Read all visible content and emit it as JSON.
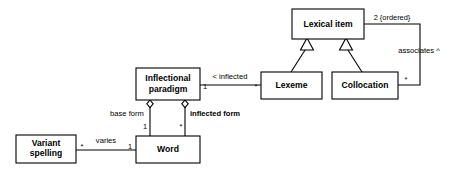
{
  "diagram": {
    "type": "uml-class-diagram",
    "background_color": "#ffffff",
    "line_color": "#000000",
    "fill_color": "#ffffff",
    "classes": [
      {
        "id": "lexical_item",
        "name": "Lexical item",
        "line1": "Lexical item",
        "line2": "",
        "x": 292,
        "y": 9,
        "w": 72,
        "h": 30
      },
      {
        "id": "lexeme",
        "name": "Lexeme",
        "line1": "Lexeme",
        "line2": "",
        "x": 261,
        "y": 72,
        "w": 61,
        "h": 27
      },
      {
        "id": "collocation",
        "name": "Collocation",
        "line1": "Collocation",
        "line2": "",
        "x": 332,
        "y": 72,
        "w": 66,
        "h": 27
      },
      {
        "id": "inflectional_paradigm",
        "name": "Inflectional paradigm",
        "line1": "Inflectional",
        "line2": "paradigm",
        "x": 136,
        "y": 68,
        "w": 64,
        "h": 32
      },
      {
        "id": "word",
        "name": "Word",
        "line1": "Word",
        "line2": "",
        "x": 136,
        "y": 136,
        "w": 64,
        "h": 27
      },
      {
        "id": "variant_spelling",
        "name": "Variant spelling",
        "line1": "Variant",
        "line2": "spelling",
        "x": 16,
        "y": 135,
        "w": 60,
        "h": 28
      }
    ],
    "generalizations": [
      {
        "id": "lexeme_is_a_lexical_item",
        "from": "lexeme",
        "to": "lexical_item"
      },
      {
        "id": "collocation_is_a_lexical_item",
        "from": "collocation",
        "to": "lexical_item"
      }
    ],
    "associations": [
      {
        "id": "inflected",
        "from": "inflectional_paradigm",
        "to": "lexeme",
        "label": "< inflected",
        "source_multiplicity": "1",
        "target_multiplicity": "*"
      },
      {
        "id": "associates",
        "from": "lexical_item",
        "to": "collocation",
        "label": "associates ^",
        "source_multiplicity": "2 {ordered}",
        "target_multiplicity": "*"
      },
      {
        "id": "base_form",
        "from": "inflectional_paradigm",
        "to": "word",
        "label": "base form",
        "source_multiplicity": "",
        "target_multiplicity": "1",
        "kind": "aggregation"
      },
      {
        "id": "inflected_form",
        "from": "inflectional_paradigm",
        "to": "word",
        "label": "inflected form",
        "source_multiplicity": "",
        "target_multiplicity": "*",
        "kind": "aggregation"
      },
      {
        "id": "varies",
        "from": "variant_spelling",
        "to": "word",
        "label": "varies",
        "source_multiplicity": "*",
        "target_multiplicity": "1"
      }
    ]
  }
}
